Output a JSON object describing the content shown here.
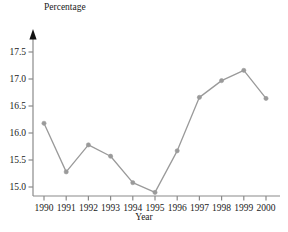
{
  "chart_data": {
    "type": "line",
    "title": "",
    "xlabel": "Year",
    "ylabel": "Percentage",
    "categories": [
      "1990",
      "1991",
      "1992",
      "1993",
      "1994",
      "1995",
      "1996",
      "1997",
      "1998",
      "1999",
      "2000"
    ],
    "x": [
      1990,
      1991,
      1992,
      1993,
      1994,
      1995,
      1996,
      1997,
      1998,
      1999,
      2000
    ],
    "values": [
      16.18,
      15.28,
      15.78,
      15.57,
      15.08,
      14.9,
      15.67,
      16.66,
      16.97,
      17.16,
      16.64
    ],
    "series": [
      {
        "name": "Percentage",
        "values": [
          16.18,
          15.28,
          15.78,
          15.57,
          15.08,
          14.9,
          15.67,
          16.66,
          16.97,
          17.16,
          16.64
        ]
      }
    ],
    "ytick_labels": [
      "15.0",
      "15.5",
      "16.0",
      "16.5",
      "17.0",
      "17.5"
    ],
    "ytick_values": [
      15.0,
      15.5,
      16.0,
      16.5,
      17.0,
      17.5
    ],
    "xtick_labels": [
      "1990",
      "1991",
      "1992",
      "1993",
      "1994",
      "1995",
      "1996",
      "1997",
      "1998",
      "1999",
      "2000"
    ],
    "ylim": [
      14.76,
      17.75
    ],
    "xlim": [
      1989.62,
      2000.38
    ],
    "grid": false,
    "legend": "none",
    "marker": "circle",
    "line_color": "#9a9a9a",
    "marker_color": "#9a9a9a",
    "axis_color": "#8a8a8a",
    "text_color": "#1a1a1a",
    "background": "#ffffff",
    "y_axis_arrow": true
  }
}
